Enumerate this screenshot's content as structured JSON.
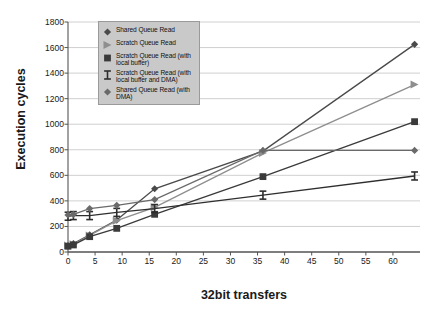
{
  "chart_data": {
    "type": "line",
    "title": "",
    "xlabel": "32bit transfers",
    "ylabel": "Execution cycles",
    "x": [
      0,
      1,
      4,
      9,
      16,
      36,
      64
    ],
    "xlim": [
      0,
      65
    ],
    "ylim": [
      0,
      1800
    ],
    "grid": true,
    "legend_position": "top-left-inside",
    "x_ticks": [
      "0",
      "5",
      "10",
      "15",
      "20",
      "25",
      "30",
      "35",
      "40",
      "45",
      "50",
      "55",
      "60"
    ],
    "x_tick_values": [
      0,
      5,
      10,
      15,
      20,
      25,
      30,
      35,
      40,
      45,
      50,
      55,
      60
    ],
    "y_ticks": [
      "0",
      "200",
      "400",
      "600",
      "800",
      "1000",
      "1200",
      "1400",
      "1600",
      "1800"
    ],
    "y_tick_values": [
      0,
      200,
      400,
      600,
      800,
      1000,
      1200,
      1400,
      1600,
      1800
    ],
    "series": [
      {
        "name": "Shared Queue Read",
        "marker": "diamond",
        "color": "#4a4a4a",
        "values": [
          50,
          65,
          135,
          250,
          495,
          790,
          1625
        ]
      },
      {
        "name": "Scratch Queue Read",
        "marker": "triangle",
        "color": "#8e8e8e",
        "values": [
          50,
          60,
          130,
          245,
          350,
          775,
          1310
        ]
      },
      {
        "name": "Scratch Queue Read (with local buffer)",
        "marker": "square",
        "color": "#3a3a3a",
        "values": [
          45,
          55,
          120,
          185,
          295,
          590,
          1020
        ]
      },
      {
        "name": "Scratch Queue Read (with local buffer and DMA)",
        "marker": "ibeam",
        "color": "#2e2e2e",
        "values": [
          280,
          285,
          285,
          310,
          340,
          445,
          595
        ]
      },
      {
        "name": "Shared Queue Read (with DMA)",
        "marker": "diamond",
        "color": "#6a6a6a",
        "values": [
          290,
          295,
          340,
          365,
          410,
          795,
          795
        ]
      }
    ]
  },
  "legend": {
    "items": [
      {
        "label": "Shared Queue Read",
        "marker": "diamond",
        "color": "#4a4a4a"
      },
      {
        "label": "Scratch Queue Read",
        "marker": "triangle",
        "color": "#8e8e8e"
      },
      {
        "label": "Scratch Queue Read (with local buffer)",
        "marker": "square",
        "color": "#3a3a3a"
      },
      {
        "label": "Scratch Queue Read (with local buffer and DMA)",
        "marker": "ibeam",
        "color": "#2e2e2e"
      },
      {
        "label": "Shared Queue Read (with DMA)",
        "marker": "diamond",
        "color": "#6a6a6a"
      }
    ],
    "background": "#c9c9c9",
    "border": "#9a9a9a"
  },
  "style": {
    "plot_background": "#ffffff",
    "gridline_color": "#c4c4c4",
    "axis_color": "#555555",
    "text_color": "#1a1a1a"
  }
}
